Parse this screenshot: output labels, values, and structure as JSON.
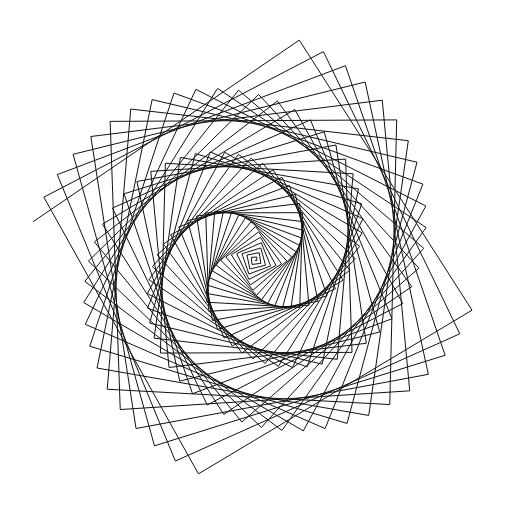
{
  "figure": {
    "type": "line-art",
    "canvas": {
      "width": 510,
      "height": 516,
      "background_color": "#ffffff"
    },
    "stroke": {
      "color": "#111111",
      "width": 1,
      "linecap": "butt",
      "linejoin": "miter"
    },
    "bounding_box": {
      "left": 33,
      "top": 28,
      "right": 472,
      "bottom": 486
    },
    "origin": {
      "x": 245,
      "y": 258,
      "label": "convergence-center"
    }
  },
  "chart_data": {
    "type": "line",
    "xlabel": "",
    "ylabel": "",
    "grid": false,
    "legend": null,
    "axes_visible": false,
    "generator": {
      "algorithm": "turtle-spiral",
      "description": "forward(step_length) then left(turn_angle), step length grows linearly each iteration",
      "start_x": 245,
      "start_y": 258,
      "start_heading_deg": 0,
      "turn_angle_deg": 91.7,
      "step_count": 180,
      "step_initial": 1.6,
      "step_increment": 1.62,
      "y_axis_down": true
    },
    "annotations": [
      {
        "name": "outer-ring",
        "approx_radius": 222,
        "center_x": 252,
        "center_y": 256
      },
      {
        "name": "inner-dense-ring",
        "approx_radius": 108,
        "center_x": 240,
        "center_y": 258
      },
      {
        "name": "radial-fan-core",
        "approx_radius": 18,
        "center_x": 245,
        "center_y": 258
      }
    ]
  }
}
